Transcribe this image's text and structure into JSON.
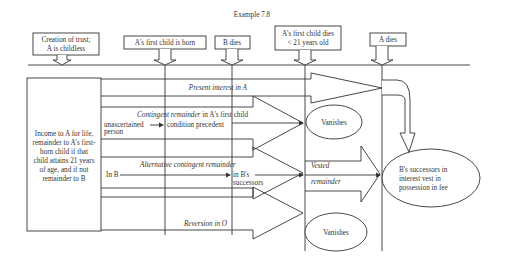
{
  "title": "Example 7.8",
  "events": [
    {
      "label_lines": [
        "Creation of trust;",
        "A is childless"
      ]
    },
    {
      "label_lines": [
        "A's first child is born"
      ]
    },
    {
      "label_lines": [
        "B dies"
      ]
    },
    {
      "label_lines": [
        "A's first child dies",
        "< 21 years old"
      ]
    },
    {
      "label_lines": [
        "A dies"
      ]
    }
  ],
  "source_box": {
    "lines": [
      "Income to A for life,",
      "remainder to A's first-",
      "born child if that",
      "child attains 21 years",
      "of age, and if not",
      "remainder to B"
    ]
  },
  "interests": {
    "present": "Present interest in A",
    "contingent_title_italic": "Contingent remainder",
    "contingent_title_rest": " in A's first child",
    "unascertained_1": "unascertained",
    "unascertained_2": "person",
    "condition": "condition precedent",
    "alternative": "Alternative contingent remainder",
    "in_b": "In B",
    "in_b_successors_1": "in B's",
    "in_b_successors_2": "successors",
    "vested_1": "Vested",
    "vested_2": "remainder",
    "reversion": "Reversion in O"
  },
  "outcomes": {
    "vanishes_1": "Vanishes",
    "vanishes_2": "Vanishes",
    "final_lines": [
      "B's successors in",
      "interest vest in",
      "possession in fee"
    ]
  }
}
